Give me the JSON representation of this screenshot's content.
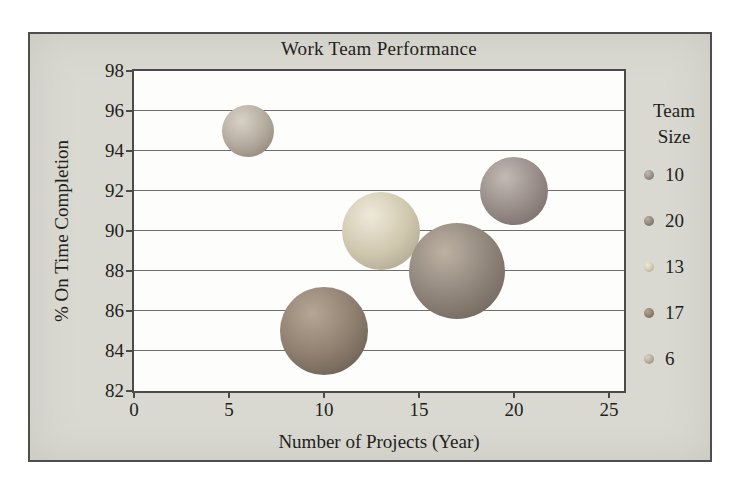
{
  "figure": {
    "background": "#d9d8d1",
    "border_color": "#4e4e4e"
  },
  "chart_data": {
    "type": "scatter",
    "subtype": "bubble",
    "title": "Work Team Performance",
    "xlabel": "Number of Projects (Year)",
    "ylabel": "% On Time Completion",
    "xlim": [
      0,
      25
    ],
    "ylim": [
      82,
      98
    ],
    "xticks": [
      0,
      5,
      10,
      15,
      20,
      25
    ],
    "yticks": [
      82,
      84,
      86,
      88,
      90,
      92,
      94,
      96,
      98
    ],
    "grid": "horizontal-only",
    "legend_position": "right",
    "legend_title_lines": [
      "Team",
      "Size"
    ],
    "bubble_radius_scale": 10.7,
    "series": [
      {
        "name": "10",
        "x": 20,
        "y": 92,
        "size": 10,
        "color": "#978c87",
        "highlight": "#c2bab4",
        "edge": "#6d635e"
      },
      {
        "name": "20",
        "x": 17,
        "y": 88,
        "size": 20,
        "color": "#8e8379",
        "highlight": "#bcb1a2",
        "edge": "#645b52"
      },
      {
        "name": "13",
        "x": 13,
        "y": 90,
        "size": 13,
        "color": "#cfc7ae",
        "highlight": "#efe9da",
        "edge": "#a29a83"
      },
      {
        "name": "17",
        "x": 10,
        "y": 85,
        "size": 17,
        "color": "#8d7e6f",
        "highlight": "#b5a695",
        "edge": "#5e5246"
      },
      {
        "name": "6",
        "x": 6,
        "y": 95,
        "size": 6,
        "color": "#b3aa9d",
        "highlight": "#d8d2c6",
        "edge": "#847b6f"
      }
    ]
  },
  "colors": {
    "plot_bg": "#fdfdfb",
    "plot_border": "#4a4a46",
    "gridline": "#6e6e6a",
    "text": "#221f1c"
  }
}
